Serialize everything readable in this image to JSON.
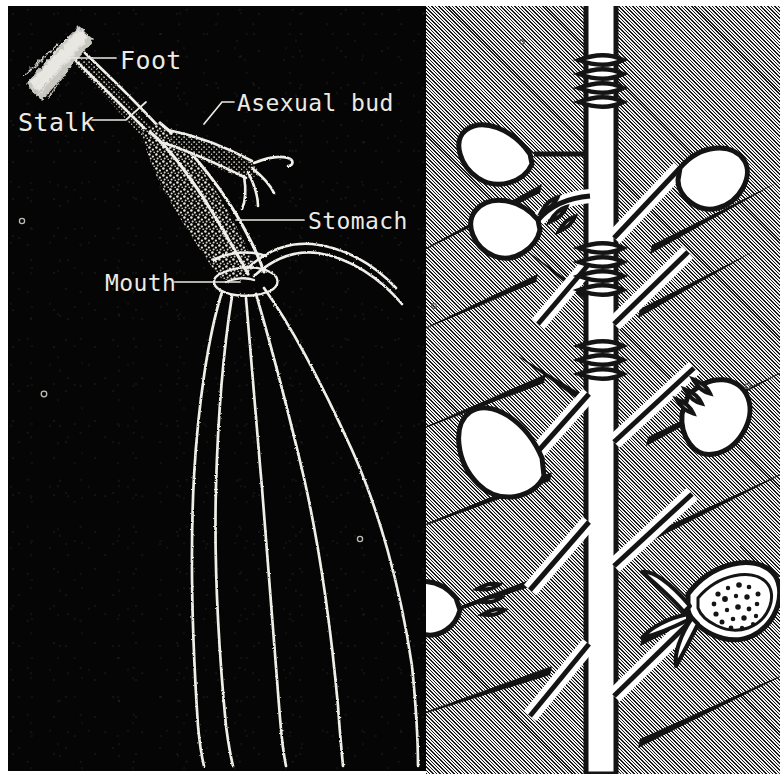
{
  "plate": {
    "title": "Hydroid colony anatomy plate",
    "panels": [
      {
        "id": "left",
        "name": "Labelled hydroid polyp diagram",
        "background_style": "dark field photomicrograph",
        "background_color": "#050505",
        "ink_color": "#f2f0ea"
      },
      {
        "id": "right",
        "name": "Hydroid colony branch with buds and sporangium",
        "background_style": "diagonal line hatching",
        "background_color": "#cccccc",
        "ink_color": "#111111",
        "fill_color": "#ffffff"
      }
    ]
  },
  "labels": [
    {
      "key": "foot",
      "text": "Foot",
      "leader": "horizontal line to attachment disc"
    },
    {
      "key": "stalk",
      "text": "Stalk",
      "leader": "diagonal line to stalk"
    },
    {
      "key": "asexual_bud",
      "text": "Asexual bud",
      "leader": "bent line to bud"
    },
    {
      "key": "stomach",
      "text": "Stomach",
      "leader": "horizontal line to stomach cavity"
    },
    {
      "key": "mouth",
      "text": "Mouth",
      "leader": "horizontal line to mouth"
    }
  ],
  "left_panel_features": {
    "foot": "fuzzy diagonal attachment disc at upper left",
    "stalk": "slender speckled column running down-right from foot",
    "stomach": "elongated densely stippled body cavity",
    "asexual_bud": "lateral bud bearing four short tentacles",
    "mouth": "ring at base of body where tentacles converge",
    "tentacle_count": 5
  },
  "right_panel_features": {
    "stem": "vertical white stem with banded ring nodes",
    "node_rings": 4,
    "leaf_buds": 6,
    "spines": 14,
    "sporangium": "stippled pod containing dark granules, lower right"
  }
}
